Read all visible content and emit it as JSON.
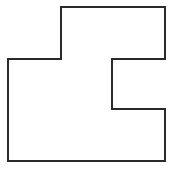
{
  "diagram": {
    "type": "rectilinear-polygon-outline",
    "shape": {
      "points": "61,7 165,7 165,59 112,59 112,109 165,109 165,161 8,161 8,59 61,59",
      "stroke": "#2a2a2a",
      "stroke_width": 2,
      "fill": "#ffffff"
    }
  }
}
